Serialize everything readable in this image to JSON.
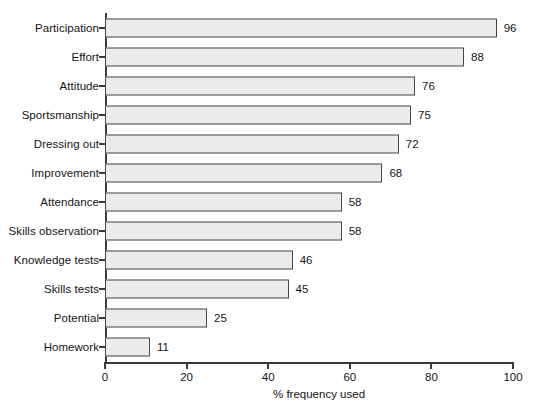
{
  "chart_data": {
    "type": "bar",
    "orientation": "horizontal",
    "title": "",
    "xlabel": "% frequency used",
    "ylabel": "",
    "xlim": [
      0,
      100
    ],
    "xticks": [
      0,
      20,
      40,
      60,
      80,
      100
    ],
    "grid": false,
    "legend": null,
    "categories": [
      "Participation",
      "Effort",
      "Attitude",
      "Sportsmanship",
      "Dressing out",
      "Improvement",
      "Attendance",
      "Skills observation",
      "Knowledge tests",
      "Skills tests",
      "Potential",
      "Homework"
    ],
    "values": [
      96,
      88,
      76,
      75,
      72,
      68,
      58,
      58,
      46,
      45,
      25,
      11
    ],
    "value_labels": [
      "96",
      "88",
      "76",
      "75",
      "72",
      "68",
      "58",
      "58",
      "46",
      "45",
      "25",
      "11"
    ],
    "colors": {
      "bar_fill": "#ebebeb",
      "bar_stroke": "#474747",
      "axis": "#3a3a3a",
      "text": "#141414",
      "background": "#ffffff"
    }
  }
}
